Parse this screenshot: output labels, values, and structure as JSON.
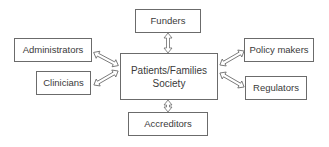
{
  "diagram": {
    "center": {
      "line1": "Patients/Families",
      "line2": "Society"
    },
    "nodes": {
      "funders": "Funders",
      "administrators": "Administrators",
      "clinicians": "Clinicians",
      "policy_makers": "Policy makers",
      "regulators": "Regulators",
      "accreditors": "Accreditors"
    },
    "edges": [
      {
        "from": "Patients/Families Society",
        "to": "Funders",
        "type": "bidirectional"
      },
      {
        "from": "Patients/Families Society",
        "to": "Administrators",
        "type": "bidirectional"
      },
      {
        "from": "Patients/Families Society",
        "to": "Clinicians",
        "type": "bidirectional"
      },
      {
        "from": "Patients/Families Society",
        "to": "Policy makers",
        "type": "bidirectional"
      },
      {
        "from": "Patients/Families Society",
        "to": "Regulators",
        "type": "bidirectional"
      },
      {
        "from": "Patients/Families Society",
        "to": "Accreditors",
        "type": "bidirectional"
      }
    ],
    "colors": {
      "border": "#6b6b6b",
      "text": "#3a3a3a",
      "background": "#ffffff"
    }
  }
}
